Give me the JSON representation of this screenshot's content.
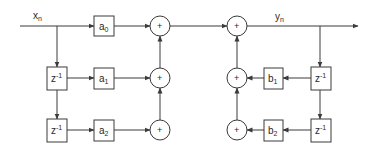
{
  "diagram": {
    "input_label": {
      "main": "x",
      "sub": "n"
    },
    "output_label": {
      "main": "y",
      "sub": "n"
    },
    "feedforward": [
      {
        "coef": "a",
        "sub": "0"
      },
      {
        "coef": "a",
        "sub": "1"
      },
      {
        "coef": "a",
        "sub": "2"
      }
    ],
    "feedback": [
      {
        "coef": "b",
        "sub": "1"
      },
      {
        "coef": "b",
        "sub": "2"
      }
    ],
    "delay": {
      "main": "z",
      "sup": "-1"
    },
    "adder_symbol": "+"
  }
}
